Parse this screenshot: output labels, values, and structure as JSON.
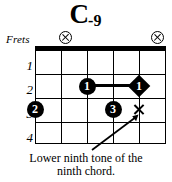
{
  "title": {
    "root": "C",
    "quality": "-9",
    "full": "C-9"
  },
  "labels": {
    "frets": "Frets"
  },
  "diagram": {
    "strings": 6,
    "frets_shown": 4,
    "fret_numbers": [
      "1",
      "2",
      "3",
      "4"
    ],
    "nut": true,
    "open_string_markers": [
      {
        "name": "mute-marker-string-2",
        "symbol": "circled-x",
        "string": 2
      },
      {
        "name": "mute-marker-string-6",
        "symbol": "circled-x",
        "string": 6
      }
    ],
    "finger_dots": [
      {
        "finger": "1",
        "string": 3,
        "fret": 2,
        "shape": "circle"
      },
      {
        "finger": "1",
        "string": 5,
        "fret": 2,
        "shape": "diamond"
      },
      {
        "finger": "2",
        "string": 1,
        "fret": 3,
        "shape": "circle"
      },
      {
        "finger": "3",
        "string": 4,
        "fret": 3,
        "shape": "circle"
      }
    ],
    "barre": {
      "from_string": 3,
      "to_string": 5,
      "fret": 2
    },
    "x_marks": [
      {
        "symbol": "x",
        "string": 5,
        "fret": 3
      }
    ]
  },
  "annotation": {
    "line1": "Lower ninth tone of the",
    "line2": "ninth chord.",
    "pointer": "arrow-up-right"
  },
  "colors": {
    "ink": "#000000",
    "paper": "#ffffff"
  }
}
